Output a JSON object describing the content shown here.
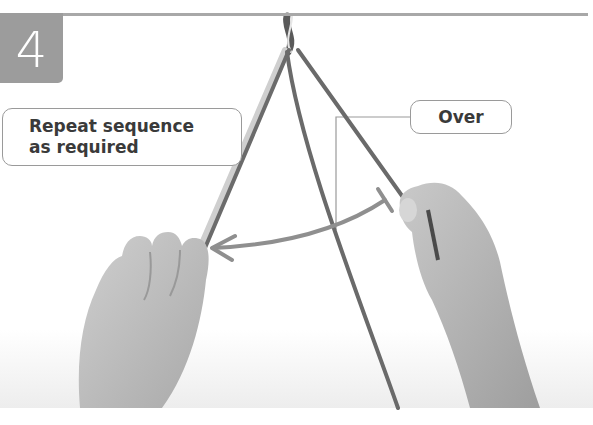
{
  "step": {
    "number": "4"
  },
  "callouts": {
    "repeat_line1": "Repeat sequence",
    "repeat_line2": "as required",
    "over": "Over"
  },
  "colors": {
    "badge": "#9c9c9c",
    "rule": "#a8a8a8",
    "arrow": "#8f8f8f",
    "cord": "#6a6a6a",
    "skin": "#bdbdbd"
  }
}
